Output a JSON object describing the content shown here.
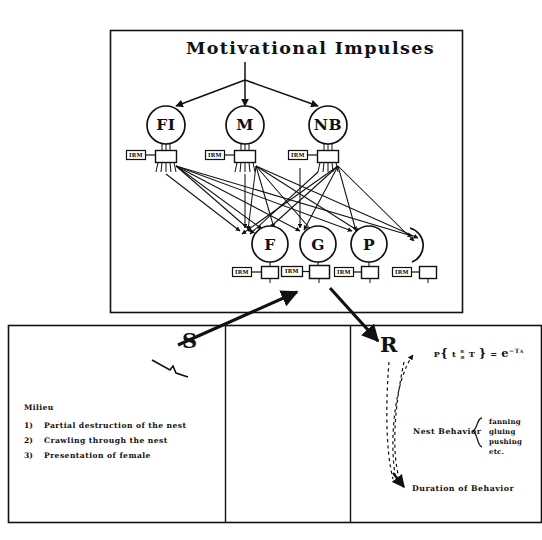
{
  "figure": {
    "title": "Motivational Impulses",
    "background_color": "#ffffff",
    "ink_color": "#111111"
  },
  "upper_panel": {
    "motivation_nodes": [
      {
        "label": "FI",
        "name": "node-fi"
      },
      {
        "label": "M",
        "name": "node-m"
      },
      {
        "label": "NB",
        "name": "node-nb"
      }
    ],
    "behavior_nodes": [
      {
        "label": "F",
        "name": "node-f"
      },
      {
        "label": "G",
        "name": "node-g"
      },
      {
        "label": "P",
        "name": "node-p"
      }
    ],
    "irm_label": "IRM",
    "upper_irm_count": 3,
    "lower_irm_count": 4
  },
  "stimulus": {
    "label": "S"
  },
  "response": {
    "label": "R"
  },
  "milieu": {
    "heading": "Milieu",
    "items": [
      {
        "number": "1)",
        "text": "Partial destruction of the nest"
      },
      {
        "number": "2)",
        "text": "Crawling through the nest"
      },
      {
        "number": "3)",
        "text": "Presentation of female"
      }
    ]
  },
  "response_detail": {
    "formula": {
      "prefix": "P",
      "open_brace": "{",
      "variable": "t",
      "relation_top": "≥",
      "relation_bottom": "≤",
      "threshold": "T",
      "close_brace": "}",
      "equals": "=",
      "base": "e",
      "exponent": "−T",
      "exponent_sup": "A",
      "plain": "P { t ≳ T } = e⁻ᵀᴬ"
    },
    "nest_behavior_label": "Nest Behavior",
    "nest_behavior_items": [
      "fanning",
      "gluing",
      "pushing",
      "etc."
    ],
    "duration_label": "Duration of Behavior"
  }
}
